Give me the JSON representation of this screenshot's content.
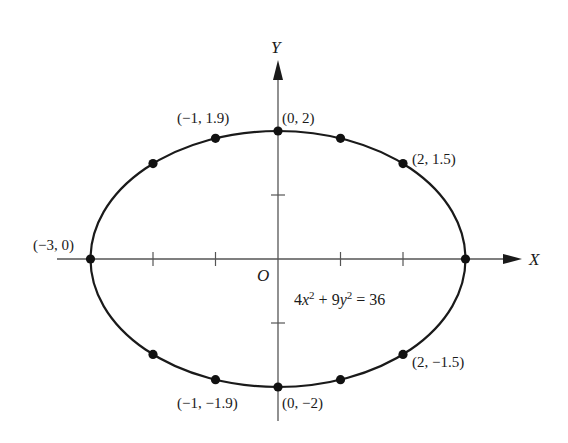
{
  "chart_data": {
    "type": "scatter",
    "title": "",
    "xlabel": "X",
    "ylabel": "Y",
    "origin_label": "O",
    "equation": {
      "parts": [
        {
          "t": "4",
          "style": "normal"
        },
        {
          "t": "x",
          "style": "italic"
        },
        {
          "t": "2",
          "style": "sup"
        },
        {
          "t": " + 9",
          "style": "normal"
        },
        {
          "t": "y",
          "style": "italic"
        },
        {
          "t": "2",
          "style": "sup"
        },
        {
          "t": " = 36",
          "style": "normal"
        }
      ],
      "text": "4x^2 + 9y^2 = 36"
    },
    "curve": {
      "kind": "ellipse",
      "a": 3,
      "b": 2,
      "cx": 0,
      "cy": 0
    },
    "xlim": [
      -3.4,
      3.9
    ],
    "ylim": [
      -2.5,
      3.1
    ],
    "grid": false,
    "x_ticks": [
      -2,
      -1,
      1,
      2
    ],
    "y_ticks": [
      -1,
      1
    ],
    "points": [
      {
        "x": -3,
        "y": 0,
        "label": "(-3, 0)"
      },
      {
        "x": -2,
        "y": 1.5,
        "label": ""
      },
      {
        "x": -1,
        "y": 1.9,
        "label": "(-1, 1.9)"
      },
      {
        "x": 0,
        "y": 2,
        "label": "(0, 2)"
      },
      {
        "x": 1,
        "y": 1.9,
        "label": ""
      },
      {
        "x": 2,
        "y": 1.5,
        "label": "(2, 1.5)"
      },
      {
        "x": 3,
        "y": 0,
        "label": ""
      },
      {
        "x": 2,
        "y": -1.5,
        "label": "(2, -1.5)"
      },
      {
        "x": 1,
        "y": -1.9,
        "label": ""
      },
      {
        "x": 0,
        "y": -2,
        "label": "(0, -2)"
      },
      {
        "x": -1,
        "y": -1.9,
        "label": "(-1, -1.9)"
      },
      {
        "x": -2,
        "y": -1.5,
        "label": ""
      }
    ]
  },
  "display": {
    "labels": {
      "p_m3_0": "(−3, 0)",
      "p_m1_19": "(−1, 1.9)",
      "p_0_2": "(0, 2)",
      "p_2_15": "(2, 1.5)",
      "p_2_m15": "(2, −1.5)",
      "p_0_m2": "(0, −2)",
      "p_m1_m19": "(−1, −1.9)"
    },
    "colors": {
      "ink": "#1a1a1a",
      "axis": "#555555",
      "background": "#ffffff"
    }
  }
}
